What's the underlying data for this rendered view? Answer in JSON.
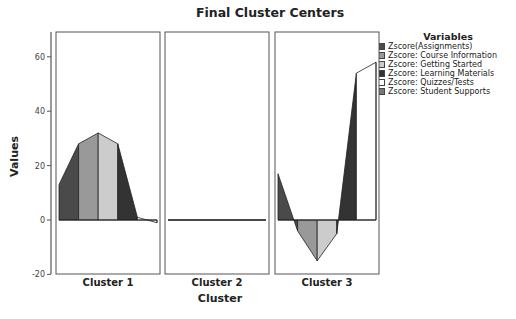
{
  "chart_data": {
    "type": "area",
    "title": "Final Cluster Centers",
    "xlabel": "Cluster",
    "ylabel": "Values",
    "ylim": [
      -20,
      70
    ],
    "yticks": [
      -20,
      0,
      20,
      40,
      60
    ],
    "legend_title": "Variables",
    "legend_position": "right",
    "grid": false,
    "categories": [
      "Cluster 1",
      "Cluster 2",
      "Cluster 3"
    ],
    "series": [
      {
        "name": "Zscore(Assignments)",
        "color": "#4a4a4a",
        "values": [
          13,
          0,
          17
        ]
      },
      {
        "name": "Zscore:  Course Information",
        "color": "#999999",
        "values": [
          28,
          0,
          -4
        ]
      },
      {
        "name": "Zscore:  Getting Started",
        "color": "#cccccc",
        "values": [
          32,
          0,
          -15
        ]
      },
      {
        "name": "Zscore:  Learning Materials",
        "color": "#333333",
        "values": [
          28,
          0,
          -5
        ]
      },
      {
        "name": "Zscore:  Quizzes/Tests",
        "color": "#ffffff",
        "values": [
          1,
          0,
          54
        ]
      },
      {
        "name": "Zscore:  Student Supports",
        "color": "#777777",
        "values": [
          -1,
          0,
          58
        ]
      }
    ]
  }
}
